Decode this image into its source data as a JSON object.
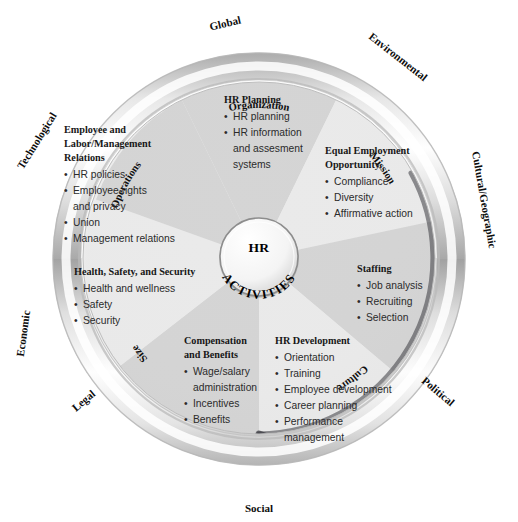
{
  "diagram": {
    "hub": {
      "line1": "HR",
      "line2": "ACTIVITIES"
    },
    "colors": {
      "wedge_light": "#e8e8e8",
      "wedge_dark": "#cfcfcf",
      "ring_outer": "#f2f2f2",
      "ring_highlight": "#ffffff",
      "ring_shadow": "#9a9a9a",
      "inner_shadow_arc": "#55555a",
      "text_dark": "#171717",
      "background": "#ffffff"
    },
    "segments": [
      {
        "id": "hr-planning",
        "title": "HR Planning",
        "items": [
          "HR planning",
          "HR information",
          "and assesment",
          "systems"
        ],
        "shade": "dark"
      },
      {
        "id": "equal-employment-opportunity",
        "title_lines": [
          "Equal Employment",
          "Opportunity"
        ],
        "title": "Equal Employment Opportunity",
        "items": [
          "Compliance",
          "Diversity",
          "Affirmative action"
        ],
        "shade": "light"
      },
      {
        "id": "staffing",
        "title": "Staffing",
        "items": [
          "Job analysis",
          "Recruiting",
          "Selection"
        ],
        "shade": "dark"
      },
      {
        "id": "hr-development",
        "title": "HR Development",
        "items": [
          "Orientation",
          "Training",
          "Employee development",
          "Career planning",
          "Performance",
          "management"
        ],
        "shade": "light"
      },
      {
        "id": "compensation-and-benefits",
        "title_lines": [
          "Compensation",
          "and Benefits"
        ],
        "title": "Compensation and Benefits",
        "items": [
          "Wage/salary",
          "administration",
          "Incentives",
          "Benefits"
        ],
        "shade": "dark"
      },
      {
        "id": "health-safety-and-security",
        "title": "Health, Safety, and Security",
        "items": [
          "Health and wellness",
          "Safety",
          "Security"
        ],
        "shade": "light"
      },
      {
        "id": "employee-and-labor-management-relations",
        "title_lines": [
          "Employee and",
          "Labor/Management",
          "Relations"
        ],
        "title": "Employee and Labor/Management Relations",
        "items": [
          "HR policies",
          "Employee rights",
          "and privacy",
          "Union",
          "Management relations"
        ],
        "shade": "dark"
      }
    ],
    "environment_labels": [
      {
        "id": "global",
        "text": "Global"
      },
      {
        "id": "environmental",
        "text": "Environmental"
      },
      {
        "id": "cultural-geographic",
        "text": "Cultural/Geographic"
      },
      {
        "id": "political",
        "text": "Political"
      },
      {
        "id": "social",
        "text": "Social"
      },
      {
        "id": "legal",
        "text": "Legal"
      },
      {
        "id": "economic",
        "text": "Economic"
      },
      {
        "id": "technological",
        "text": "Technological"
      }
    ],
    "organization_labels": [
      {
        "id": "organization",
        "text": "Organization"
      },
      {
        "id": "mission",
        "text": "Mission"
      },
      {
        "id": "culture",
        "text": "Culture"
      },
      {
        "id": "size",
        "text": "Size"
      },
      {
        "id": "operations",
        "text": "Operations"
      }
    ]
  }
}
